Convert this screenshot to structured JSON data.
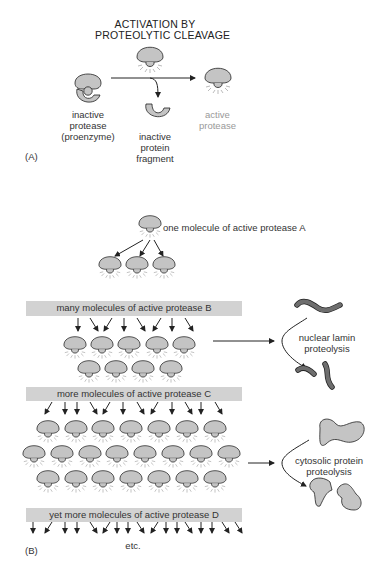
{
  "panel_a": {
    "label": "(A)",
    "title_line1": "ACTIVATION BY",
    "title_line2": "PROTEOLYTIC CLEAVAGE",
    "inactive_protease": [
      "inactive",
      "protease",
      "(proenzyme)"
    ],
    "inactive_fragment": [
      "inactive",
      "protein",
      "fragment"
    ],
    "active_protease": [
      "active",
      "protease"
    ]
  },
  "panel_b": {
    "label": "(B)",
    "protease_a_label": "one molecule of active protease A",
    "bar_b": "many molecules of active protease B",
    "bar_c": "more molecules of active protease C",
    "bar_d": "yet more molecules of active protease D",
    "etc": "etc.",
    "nuclear_lamin": [
      "nuclear lamin",
      "proteolysis"
    ],
    "cytosolic": [
      "cytosolic protein",
      "proteolysis"
    ]
  },
  "colors": {
    "protein_fill": "#c4c4c4",
    "bar_fill": "#d2d2d2",
    "lamin_fill": "#6e6e6e",
    "stroke": "#222222",
    "text": "#333333",
    "active_text": "#999999"
  },
  "layout": {
    "row_a": [
      [
        150,
        224
      ]
    ],
    "row_3": [
      [
        110,
        265
      ],
      [
        137,
        265
      ],
      [
        164,
        265
      ]
    ],
    "row_b1": [
      [
        75,
        345
      ],
      [
        102,
        345
      ],
      [
        129,
        345
      ],
      [
        157,
        345
      ],
      [
        184,
        345
      ]
    ],
    "row_b2": [
      [
        89,
        369
      ],
      [
        116,
        369
      ],
      [
        143,
        369
      ],
      [
        171,
        369
      ]
    ],
    "row_c1": [
      [
        48,
        429
      ],
      [
        76,
        429
      ],
      [
        103,
        429
      ],
      [
        131,
        429
      ],
      [
        159,
        429
      ],
      [
        187,
        429
      ],
      [
        215,
        429
      ]
    ],
    "row_c2": [
      [
        34,
        454
      ],
      [
        62,
        454
      ],
      [
        90,
        454
      ],
      [
        117,
        454
      ],
      [
        145,
        454
      ],
      [
        173,
        454
      ],
      [
        201,
        454
      ],
      [
        229,
        454
      ]
    ],
    "row_c3": [
      [
        48,
        479
      ],
      [
        76,
        479
      ],
      [
        103,
        479
      ],
      [
        131,
        479
      ],
      [
        159,
        479
      ],
      [
        187,
        479
      ],
      [
        215,
        479
      ]
    ]
  }
}
